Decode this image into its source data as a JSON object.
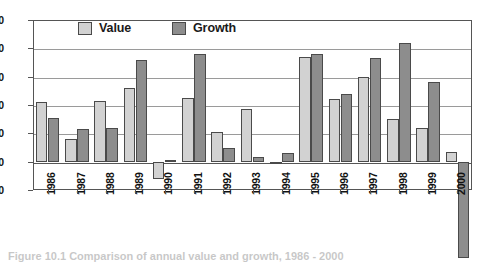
{
  "chart_data": {
    "type": "bar",
    "title": "",
    "subtitle": "",
    "xlabel": "",
    "ylabel": "",
    "categories": [
      "1986",
      "1987",
      "1988",
      "1989",
      "1990",
      "1991",
      "1992",
      "1993",
      "1994",
      "1995",
      "1996",
      "1997",
      "1998",
      "1999",
      "2000"
    ],
    "series": [
      {
        "name": "Value",
        "color": "#d2d2d2",
        "values": [
          21,
          8,
          21.5,
          26,
          -6,
          22.5,
          10.5,
          18.5,
          0,
          37,
          22,
          30,
          15,
          12,
          3.5
        ]
      },
      {
        "name": "Growth",
        "color": "#8d8d8d",
        "values": [
          15.5,
          11.5,
          12,
          36,
          0.5,
          38,
          5,
          1.5,
          3,
          38,
          24,
          36.5,
          42,
          28,
          -34
        ]
      }
    ],
    "ylim": [
      -10,
      50
    ],
    "yticks": [
      50,
      40,
      30,
      20,
      10,
      0,
      -10
    ],
    "ytick_labels": [
      "50",
      "40",
      "30",
      "20",
      "10",
      "0",
      "-10"
    ],
    "grid": true,
    "legend_position": "top-inside"
  },
  "legend": {
    "items": [
      {
        "label": "Value"
      },
      {
        "label": "Growth"
      }
    ]
  },
  "caption": {
    "fragment": "Figure 10.1 Comparison of annual value and growth, 1986 - 2000"
  },
  "colors": {
    "value_fill": "#d2d2d2",
    "growth_fill": "#8d8d8d",
    "bar_outline": "#4a4a4a",
    "gridline": "#9a9a9a",
    "axis": "#555555",
    "text": "#111111",
    "background": "#ffffff"
  }
}
